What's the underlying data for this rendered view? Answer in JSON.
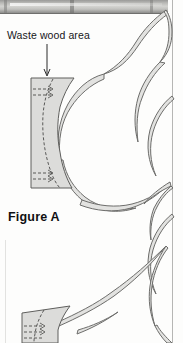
{
  "page": {
    "kind": "woodworking-plan-diagram",
    "background_color": "#fdfdfc",
    "border_rule_color": "#b6b6b4"
  },
  "photo_strip": {
    "name": "scanned-photo-strip",
    "description": "grayscale photograph band across the top of the page",
    "base_color": "#c2c2bf"
  },
  "labels": {
    "waste_area": "Waste wood area",
    "figure": "Figure A"
  },
  "callout": {
    "name": "waste-wood-leader",
    "points_to": "Waste wood area"
  },
  "diagram": {
    "band_fill": "#e2e2e0",
    "band_stroke": "#6d6d6b",
    "waste_fill": "#dcdcda",
    "waste_stroke": "#5f5f5d",
    "cutline_stroke": "#4a4a48",
    "parts": [
      "upper-waste-block",
      "lower-waste-block",
      "curved-band-top",
      "curved-band-middle",
      "curved-band-bottom"
    ]
  }
}
